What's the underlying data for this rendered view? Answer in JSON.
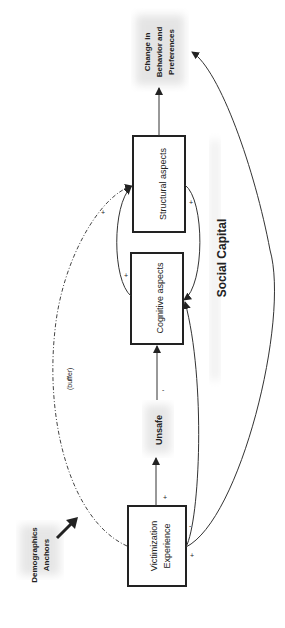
{
  "diagram": {
    "orientation": "rotated-90-ccw",
    "title": "Social Capital",
    "nodes": {
      "demographics": {
        "line1": "Demographics",
        "line2": "Anchors"
      },
      "victimization": {
        "line1": "Victimization",
        "line2": "Experience"
      },
      "unsafe": {
        "label": "Unsafe"
      },
      "cognitive": {
        "label": "Cognitive aspects"
      },
      "structural": {
        "label": "Structural aspects"
      },
      "change": {
        "line1": "Change in",
        "line2": "Behavior and",
        "line3": "Preferences"
      }
    },
    "edges": [
      {
        "from": "victimization",
        "to": "unsafe",
        "sign": "+"
      },
      {
        "from": "unsafe",
        "to": "cognitive",
        "sign": "-"
      },
      {
        "from": "cognitive",
        "to": "structural",
        "sign": "+"
      },
      {
        "from": "structural",
        "to": "cognitive",
        "sign": "+"
      },
      {
        "from": "structural",
        "to": "change",
        "sign": ""
      },
      {
        "from": "victimization",
        "to": "cognitive",
        "sign": "-"
      },
      {
        "from": "victimization",
        "to": "change",
        "sign": "+"
      },
      {
        "from": "victimization",
        "to": "structural",
        "sign": "+",
        "style": "dash-dot",
        "label": "(buffer)"
      },
      {
        "from": "demographics",
        "to": "victimization",
        "sign": "",
        "style": "thick-arrow"
      }
    ],
    "labels": {
      "buffer": "(buffer)",
      "plus": "+",
      "minus": "-"
    },
    "colors": {
      "ink": "#222222",
      "halo": "#e6e6e6"
    }
  }
}
